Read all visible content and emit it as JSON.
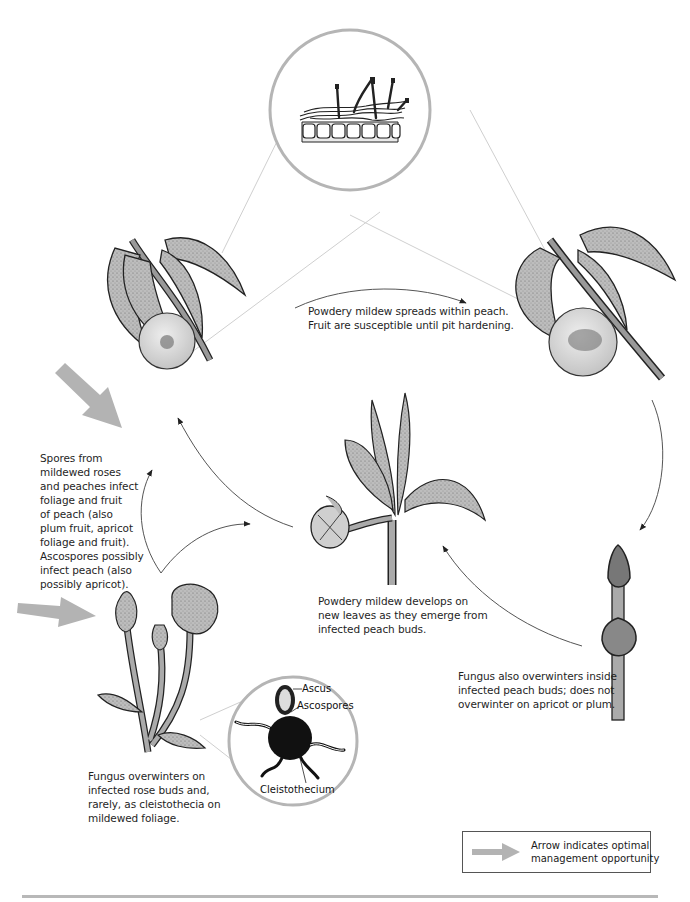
{
  "diagram": {
    "type": "disease-cycle",
    "colors": {
      "ink": "#1a1a1a",
      "plant_fill": "#b9b9b9",
      "fruit_fill": "#d6d6d6",
      "magnifier_ring": "#b5b5b5",
      "leader_line": "#c8c8c8",
      "management_arrow": "#b3b3b3",
      "cycle_arrow": "#555555",
      "rule": "#b8b8b8"
    },
    "stages": [
      {
        "id": "peach-fruit-early",
        "illustration": "peach twig with leaves and small fruit showing mildew spot",
        "caption_lines": []
      },
      {
        "id": "peach-fruit-late",
        "illustration": "peach twig with leaves and fruit showing spreading mildew lesion",
        "caption_lines": []
      },
      {
        "id": "spread-within-peach",
        "caption_lines": [
          "Powdery mildew spreads within peach.",
          "Fruit are susceptible until pit hardening."
        ]
      },
      {
        "id": "new-leaves",
        "illustration": "emerging peach shoot with young infected leaves and bud",
        "caption_lines": [
          "Powdery mildew develops on",
          "new leaves as they emerge from",
          "infected peach buds."
        ]
      },
      {
        "id": "peach-bud-overwinter",
        "illustration": "dormant peach twig with buds",
        "caption_lines": [
          "Fungus also overwinters inside",
          "infected peach buds; does not",
          "overwinter on apricot or plum."
        ]
      },
      {
        "id": "rose-overwinter",
        "illustration": "rose stem with mildewed buds",
        "caption_lines": [
          "Fungus overwinters on",
          "infected rose buds and,",
          "rarely, as cleistothecia on",
          "mildewed foliage."
        ]
      },
      {
        "id": "spore-infection",
        "caption_lines": [
          "Spores from",
          "mildewed roses",
          "and peaches infect",
          "foliage and fruit",
          "of peach (also",
          "plum fruit, apricot",
          "foliage and fruit).",
          "Ascospores possibly",
          "infect peach (also",
          "possibly apricot)."
        ]
      }
    ],
    "magnified_views": [
      {
        "id": "mycelium-on-leaf-surface",
        "illustration": "cross-section of leaf epidermal cells with fungal hyphae and conidiophores",
        "labels": []
      },
      {
        "id": "cleistothecium-detail",
        "illustration": "cleistothecium with appendages releasing ascus",
        "labels": [
          "Ascus",
          "Ascospores",
          "Cleistothecium"
        ]
      }
    ],
    "management_arrows": [
      {
        "id": "arrow-spring-infection",
        "direction": "down-right"
      },
      {
        "id": "arrow-rose-overwinter",
        "direction": "right"
      }
    ],
    "legend": {
      "icon": "gray-arrow-icon",
      "lines": [
        "Arrow indicates optimal",
        "management opportunity"
      ]
    }
  }
}
